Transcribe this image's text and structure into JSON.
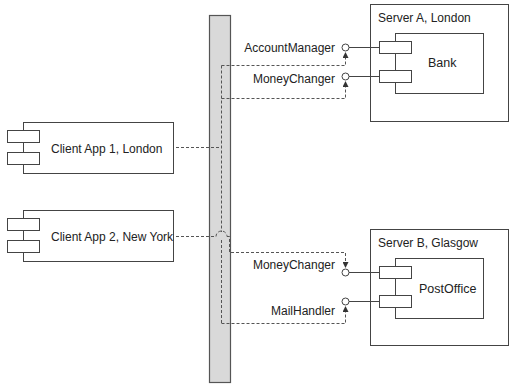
{
  "diagram": {
    "type": "UML deployment/component diagram",
    "colors": {
      "line": "#444444",
      "bus_fill": "#d9d9d9",
      "background": "#ffffff"
    },
    "bus": {
      "name": "middleware-bus"
    },
    "clients": [
      {
        "label": "Client App 1, London"
      },
      {
        "label": "Client App 2, New York"
      }
    ],
    "servers": [
      {
        "label": "Server A, London",
        "component": "Bank",
        "interfaces": [
          "AccountManager",
          "MoneyChanger"
        ]
      },
      {
        "label": "Server B, Glasgow",
        "component": "PostOffice",
        "interfaces": [
          "MoneyChanger",
          "MailHandler"
        ]
      }
    ]
  }
}
